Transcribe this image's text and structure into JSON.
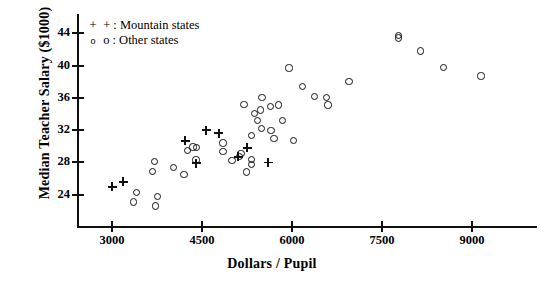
{
  "chart_data": {
    "type": "scatter",
    "title": "",
    "xlabel": "Dollars / Pupil",
    "ylabel": "Median Teacher Salary ($1000)",
    "xlim": [
      2400,
      9600
    ],
    "ylim": [
      21.5,
      45.5
    ],
    "xticks": [
      "3000",
      "4500",
      "6000",
      "7500",
      "9000"
    ],
    "xtick_values": [
      3000,
      4500,
      6000,
      7500,
      9000
    ],
    "yticks": [
      "24",
      "28",
      "32",
      "36",
      "40",
      "44"
    ],
    "ytick_values": [
      24,
      28,
      32,
      36,
      40,
      44
    ],
    "grid": false,
    "legend_position": "top-left",
    "series": [
      {
        "name": "Mountain states",
        "marker": "plus",
        "legend_symbol": "+",
        "legend_label": "+ : Mountain states",
        "points": [
          [
            3000,
            25.0
          ],
          [
            3185,
            25.6
          ],
          [
            4220,
            30.7
          ],
          [
            4570,
            32.0
          ],
          [
            4780,
            31.6
          ],
          [
            4400,
            27.9
          ],
          [
            5250,
            29.8
          ],
          [
            5100,
            28.7
          ],
          [
            5600,
            28.0
          ]
        ]
      },
      {
        "name": "Other states",
        "marker": "circle",
        "legend_symbol": "o",
        "legend_label": "o : Other states",
        "points": [
          [
            3415,
            24.3
          ],
          [
            3365,
            23.1
          ],
          [
            3715,
            28.1
          ],
          [
            3680,
            26.9
          ],
          [
            3760,
            23.8
          ],
          [
            3730,
            22.6
          ],
          [
            4265,
            29.5
          ],
          [
            4350,
            29.9
          ],
          [
            4415,
            29.8
          ],
          [
            4850,
            30.4
          ],
          [
            4850,
            29.4
          ],
          [
            4020,
            27.4
          ],
          [
            4400,
            28.3
          ],
          [
            4200,
            26.5
          ],
          [
            5000,
            28.2
          ],
          [
            5130,
            28.7
          ],
          [
            5150,
            29.1
          ],
          [
            5330,
            28.4
          ],
          [
            5330,
            27.7
          ],
          [
            5240,
            26.8
          ],
          [
            5330,
            31.3
          ],
          [
            5650,
            32.0
          ],
          [
            5490,
            32.2
          ],
          [
            5430,
            33.2
          ],
          [
            5380,
            34.1
          ],
          [
            5840,
            33.2
          ],
          [
            5700,
            31.0
          ],
          [
            5950,
            39.7
          ],
          [
            5640,
            34.9
          ],
          [
            5200,
            35.2
          ],
          [
            6020,
            30.7
          ],
          [
            5500,
            36.0
          ],
          [
            6180,
            37.4
          ],
          [
            6380,
            36.2
          ],
          [
            6575,
            36.0
          ],
          [
            6600,
            35.1
          ],
          [
            5780,
            35.1
          ],
          [
            5480,
            34.5
          ],
          [
            6950,
            38.0
          ],
          [
            7770,
            43.7
          ],
          [
            7770,
            43.4
          ],
          [
            8140,
            41.8
          ],
          [
            8530,
            39.8
          ],
          [
            9150,
            38.7
          ]
        ]
      }
    ]
  },
  "axes": {
    "x_axis_name": "Dollars / Pupil",
    "y_axis_name": "Median Teacher Salary ($1000)"
  },
  "colors": {
    "ink": "#111111",
    "background": "#ffffff"
  }
}
